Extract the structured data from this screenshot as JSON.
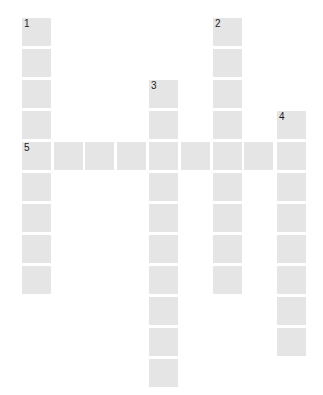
{
  "puzzle": {
    "type": "crossword-grid",
    "cell_color": "#e5e5e5",
    "number_color": "#1a1a1a",
    "column_x": [
      22,
      54,
      85,
      117,
      149,
      181,
      213,
      244,
      277
    ],
    "row_y": [
      18,
      49,
      80,
      111,
      142,
      173,
      204,
      235,
      266,
      297,
      328,
      359
    ],
    "entries": [
      {
        "number": "1",
        "direction": "down",
        "col": 0,
        "row": 0,
        "length": 9
      },
      {
        "number": "2",
        "direction": "down",
        "col": 6,
        "row": 0,
        "length": 9
      },
      {
        "number": "3",
        "direction": "down",
        "col": 4,
        "row": 2,
        "length": 10
      },
      {
        "number": "4",
        "direction": "down",
        "col": 8,
        "row": 3,
        "length": 8
      },
      {
        "number": "5",
        "direction": "across",
        "col": 0,
        "row": 4,
        "length": 9
      }
    ]
  }
}
